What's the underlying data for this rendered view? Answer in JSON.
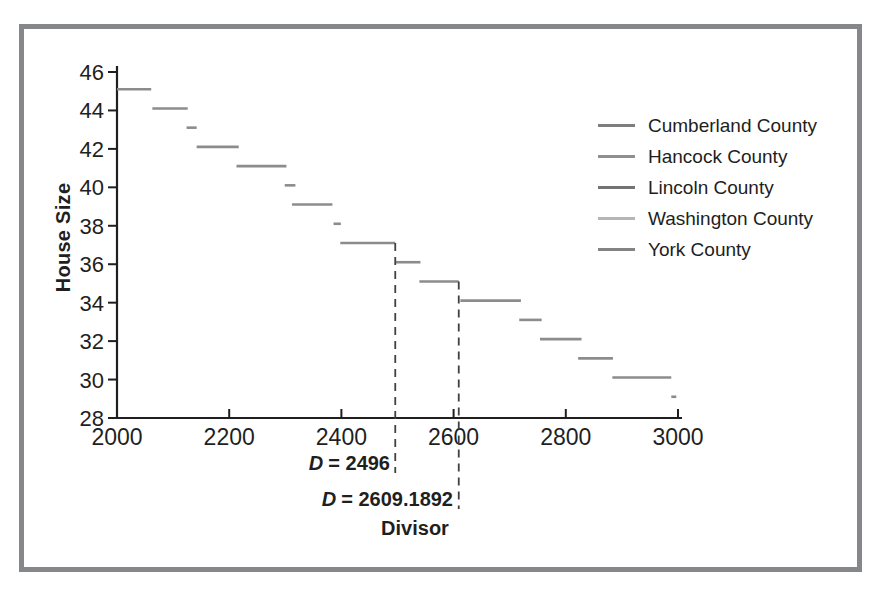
{
  "frame": {
    "border_color": "#85878a",
    "background_color": "#ffffff"
  },
  "chart_data": {
    "type": "step",
    "title": "",
    "xlabel": "Divisor",
    "ylabel": "House Size",
    "xlim": [
      2000,
      3000
    ],
    "ylim": [
      28,
      46
    ],
    "x_ticks": [
      "2000",
      "2200",
      "2400",
      "2600",
      "2800",
      "3000"
    ],
    "x_tick_values": [
      2000,
      2200,
      2400,
      2600,
      2800,
      3000
    ],
    "y_ticks": [
      "46",
      "44",
      "42",
      "40",
      "38",
      "36",
      "34",
      "32",
      "30",
      "28"
    ],
    "y_tick_values": [
      46,
      44,
      42,
      40,
      38,
      36,
      34,
      32,
      30,
      28
    ],
    "grid": false,
    "axis_color": "#1f1f1f",
    "line_color": "#8c8c8c",
    "dashed_line_color": "#404040",
    "legend": {
      "position": "upper right",
      "items": [
        {
          "label": "Cumberland County",
          "line_color": "#7e7e7e"
        },
        {
          "label": "Hancock County",
          "line_color": "#8f8f8f"
        },
        {
          "label": "Lincoln County",
          "line_color": "#737373"
        },
        {
          "label": "Washington County",
          "line_color": "#b5b5b5"
        },
        {
          "label": "York County",
          "line_color": "#838383"
        }
      ]
    },
    "steps": [
      {
        "house_size": 45,
        "divisor_start": 2000,
        "divisor_end": 2061
      },
      {
        "house_size": 44,
        "divisor_start": 2063,
        "divisor_end": 2126
      },
      {
        "house_size": 43,
        "divisor_start": 2124,
        "divisor_end": 2142
      },
      {
        "house_size": 42,
        "divisor_start": 2142,
        "divisor_end": 2217
      },
      {
        "house_size": 41,
        "divisor_start": 2213,
        "divisor_end": 2302
      },
      {
        "house_size": 40,
        "divisor_start": 2299,
        "divisor_end": 2318
      },
      {
        "house_size": 39,
        "divisor_start": 2312,
        "divisor_end": 2384
      },
      {
        "house_size": 38,
        "divisor_start": 2386,
        "divisor_end": 2399
      },
      {
        "house_size": 37,
        "divisor_start": 2398,
        "divisor_end": 2496
      },
      {
        "house_size": 36,
        "divisor_start": 2496,
        "divisor_end": 2541
      },
      {
        "house_size": 35,
        "divisor_start": 2539,
        "divisor_end": 2609
      },
      {
        "house_size": 34,
        "divisor_start": 2612,
        "divisor_end": 2720
      },
      {
        "house_size": 33,
        "divisor_start": 2717,
        "divisor_end": 2757
      },
      {
        "house_size": 32,
        "divisor_start": 2754,
        "divisor_end": 2828
      },
      {
        "house_size": 31,
        "divisor_start": 2822,
        "divisor_end": 2884
      },
      {
        "house_size": 30,
        "divisor_start": 2883,
        "divisor_end": 2988
      },
      {
        "house_size": 29,
        "divisor_start": 2988,
        "divisor_end": 2997
      }
    ],
    "annotations": [
      {
        "symbol": "D",
        "text": "= 2496",
        "divisor": 2496,
        "top_house_size": 37
      },
      {
        "symbol": "D",
        "text": "= 2609.1892",
        "divisor": 2609.1892,
        "top_house_size": 35
      }
    ]
  }
}
